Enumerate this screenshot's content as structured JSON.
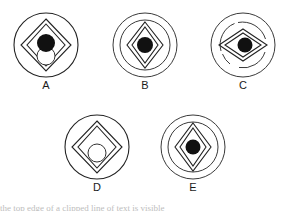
{
  "page": {
    "background_color": "#ffffff",
    "ink_color": "#222222",
    "dot_color": "#111111",
    "bottom_cut_text": "the top edge of a clipped line of text is visible"
  },
  "figures": [
    {
      "id": "A",
      "label": "A",
      "position": {
        "left": 11,
        "top": 10
      },
      "outer_circles": 1,
      "diamond_outlines": 2,
      "diamond_shape": "regular",
      "center_dot": "filled-black",
      "extra_shape": "small-hollow-circle-bottom"
    },
    {
      "id": "B",
      "label": "B",
      "position": {
        "left": 110,
        "top": 10
      },
      "outer_circles": 2,
      "diamond_outlines": 2,
      "diamond_shape": "tall",
      "center_dot": "filled-black",
      "extra_shape": "none"
    },
    {
      "id": "C",
      "label": "C",
      "position": {
        "left": 208,
        "top": 10
      },
      "outer_circles": 1,
      "diamond_outlines": 2,
      "diamond_shape": "wide",
      "center_dot": "filled-black",
      "extra_shape": "broken-spiral-arcs"
    },
    {
      "id": "D",
      "label": "D",
      "position": {
        "left": 62,
        "top": 112
      },
      "outer_circles": 1,
      "diamond_outlines": 2,
      "diamond_shape": "regular",
      "center_dot": "none",
      "extra_shape": "small-hollow-circle-center"
    },
    {
      "id": "E",
      "label": "E",
      "position": {
        "left": 158,
        "top": 112
      },
      "outer_circles": 2,
      "diamond_outlines": 2,
      "diamond_shape": "tall",
      "center_dot": "filled-black",
      "extra_shape": "none"
    }
  ]
}
